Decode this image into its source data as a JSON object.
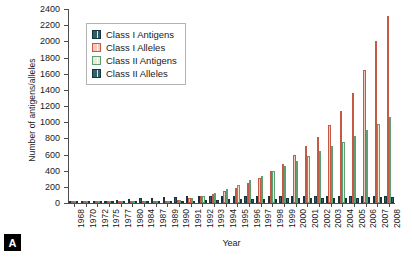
{
  "panel": {
    "label": "A"
  },
  "chart_data": {
    "type": "bar",
    "title": "",
    "xlabel": "Year",
    "ylabel": "Number of antigens/alleles",
    "ylim": [
      0,
      2400
    ],
    "ytick_step": 200,
    "yticks": [
      0,
      200,
      400,
      600,
      800,
      1000,
      1200,
      1400,
      1600,
      1800,
      2000,
      2200,
      2400
    ],
    "grid": false,
    "legend_position": "upper-left-inside",
    "categories": [
      "1968",
      "1970",
      "1972",
      "1975",
      "1977",
      "1980",
      "1984",
      "1987",
      "1989",
      "1990",
      "1991",
      "1992",
      "1993",
      "1994",
      "1995",
      "1996",
      "1997",
      "1998",
      "1999",
      "2000",
      "2001",
      "2002",
      "2003",
      "2004",
      "2005",
      "2006",
      "2007",
      "2008"
    ],
    "series": [
      {
        "name": "Class I Antigens",
        "color": "#2e5c68",
        "values": [
          12,
          16,
          20,
          28,
          35,
          45,
          60,
          68,
          75,
          80,
          83,
          85,
          86,
          87,
          88,
          88,
          88,
          88,
          88,
          88,
          88,
          88,
          88,
          88,
          88,
          88,
          88,
          88
        ]
      },
      {
        "name": "Class I Alleles",
        "color": "#f3c9bd",
        "values": [
          0,
          0,
          0,
          0,
          0,
          0,
          0,
          0,
          0,
          40,
          60,
          85,
          110,
          145,
          190,
          245,
          310,
          390,
          480,
          590,
          700,
          820,
          960,
          1140,
          1360,
          1640,
          2010,
          2310
        ]
      },
      {
        "name": "Class II Antigens",
        "color": "#e9ecd2",
        "values": [
          0,
          0,
          0,
          0,
          0,
          8,
          16,
          24,
          30,
          36,
          60,
          90,
          130,
          175,
          225,
          280,
          340,
          400,
          460,
          520,
          580,
          640,
          700,
          760,
          830,
          900,
          975,
          1060
        ]
      },
      {
        "name": "Class II Alleles",
        "color": "#31616d",
        "values": [
          0,
          0,
          0,
          0,
          0,
          0,
          0,
          0,
          0,
          20,
          28,
          34,
          40,
          44,
          48,
          50,
          52,
          54,
          56,
          58,
          60,
          62,
          64,
          66,
          68,
          70,
          72,
          74
        ]
      }
    ]
  }
}
